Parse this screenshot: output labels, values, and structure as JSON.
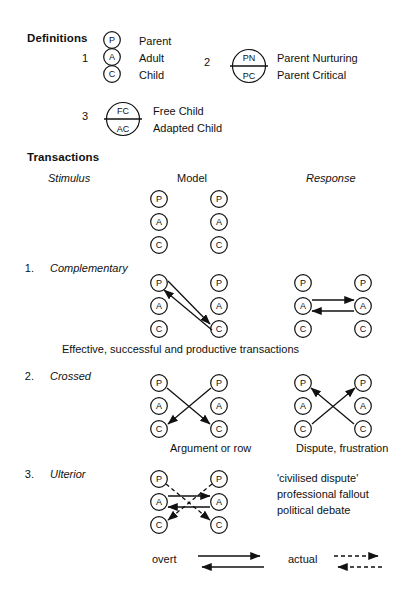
{
  "definitions": {
    "heading": "Definitions",
    "items": [
      {
        "number": "1",
        "circle_style": "stacked-three",
        "nodes": [
          "P",
          "A",
          "C"
        ],
        "labels": [
          "Parent",
          "Adult",
          "Child"
        ]
      },
      {
        "number": "2",
        "circle_style": "split-two",
        "nodes": [
          "PN",
          "PC"
        ],
        "labels": [
          "Parent Nurturing",
          "Parent Critical"
        ]
      },
      {
        "number": "3",
        "circle_style": "split-two",
        "nodes": [
          "FC",
          "AC"
        ],
        "labels": [
          "Free Child",
          "Adapted Child"
        ]
      }
    ]
  },
  "transactions": {
    "heading": "Transactions",
    "columns": {
      "stimulus": "Stimulus",
      "model": "Model",
      "response": "Response"
    },
    "model_nodes": [
      "P",
      "A",
      "C"
    ],
    "items": [
      {
        "number": "1.",
        "label": "Complementary",
        "caption": "Effective, successful and productive transactions",
        "left_caption": "",
        "right_caption": ""
      },
      {
        "number": "2.",
        "label": "Crossed",
        "caption": "",
        "left_caption": "Argument or row",
        "right_caption": "Dispute, frustration"
      },
      {
        "number": "3.",
        "label": "Ulterior",
        "caption": "",
        "notes": [
          "'civilised dispute'",
          "professional fallout",
          "political debate"
        ]
      }
    ]
  },
  "legend": {
    "overt_label": "overt",
    "actual_label": "actual"
  },
  "colors": {
    "ink": "#111111",
    "paper": "#ffffff"
  }
}
